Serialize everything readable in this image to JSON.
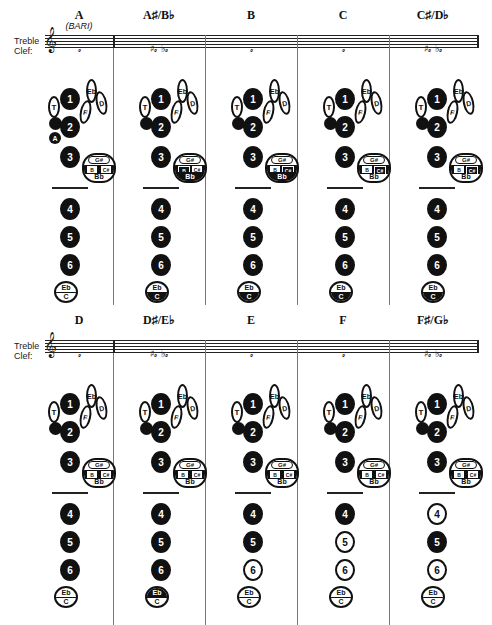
{
  "clef": {
    "line1": "Treble",
    "line2": "Clef:"
  },
  "key_labels": {
    "thumb": "T",
    "k1": "1",
    "k2": "2",
    "k3": "3",
    "k4": "4",
    "k5": "5",
    "k6": "6",
    "eb_side": "Eb",
    "f_side": "F",
    "d_side": "D",
    "gs": "G#",
    "b": "B",
    "cs": "C#",
    "bb": "Bb",
    "eb_low": "Eb",
    "c_low": "C",
    "a": "A"
  },
  "rows": [
    {
      "notes": [
        {
          "name": "A",
          "sub": "(BARI)",
          "staff_note": "𝅗",
          "keys": {
            "k1": true,
            "k2": true,
            "k3": true,
            "k4": true,
            "k5": true,
            "k6": true,
            "octave": true,
            "a": true,
            "eb_low": false,
            "c_low": false,
            "gs": false,
            "b": false,
            "cs": false,
            "bb": false
          }
        },
        {
          "name": "A♯/B♭",
          "sub": "",
          "staff_note": "♯𝅗 ♭𝅗",
          "keys": {
            "k1": true,
            "k2": true,
            "k3": true,
            "k4": true,
            "k5": true,
            "k6": true,
            "octave": true,
            "a": false,
            "eb_low": false,
            "c_low": true,
            "gs": false,
            "b": true,
            "cs": false,
            "bb": true
          }
        },
        {
          "name": "B",
          "sub": "",
          "staff_note": "𝅗",
          "keys": {
            "k1": true,
            "k2": true,
            "k3": true,
            "k4": true,
            "k5": true,
            "k6": true,
            "octave": true,
            "a": false,
            "eb_low": false,
            "c_low": true,
            "gs": false,
            "b": false,
            "cs": true,
            "bb": true
          }
        },
        {
          "name": "C",
          "sub": "",
          "staff_note": "𝅗",
          "keys": {
            "k1": true,
            "k2": true,
            "k3": true,
            "k4": true,
            "k5": true,
            "k6": true,
            "octave": true,
            "a": false,
            "eb_low": false,
            "c_low": true,
            "gs": false,
            "b": false,
            "cs": true,
            "bb": false
          }
        },
        {
          "name": "C♯/D♭",
          "sub": "",
          "staff_note": "♯𝅗 ♭𝅗",
          "keys": {
            "k1": true,
            "k2": true,
            "k3": true,
            "k4": true,
            "k5": true,
            "k6": true,
            "octave": true,
            "a": false,
            "eb_low": false,
            "c_low": true,
            "gs": false,
            "b": false,
            "cs": true,
            "bb": false
          }
        }
      ]
    },
    {
      "notes": [
        {
          "name": "D",
          "sub": "",
          "staff_note": "𝅗",
          "keys": {
            "k1": true,
            "k2": true,
            "k3": true,
            "k4": true,
            "k5": true,
            "k6": true,
            "octave": true,
            "a": false,
            "eb_low": false,
            "c_low": false,
            "gs": false,
            "b": false,
            "cs": false,
            "bb": false
          }
        },
        {
          "name": "D♯/E♭",
          "sub": "",
          "staff_note": "♯𝅗 ♭𝅗",
          "keys": {
            "k1": true,
            "k2": true,
            "k3": true,
            "k4": true,
            "k5": true,
            "k6": true,
            "octave": true,
            "a": false,
            "eb_low": true,
            "c_low": false,
            "gs": false,
            "b": false,
            "cs": false,
            "bb": false
          }
        },
        {
          "name": "E",
          "sub": "",
          "staff_note": "𝅗",
          "keys": {
            "k1": true,
            "k2": true,
            "k3": true,
            "k4": true,
            "k5": true,
            "k6": false,
            "octave": true,
            "a": false,
            "eb_low": false,
            "c_low": false,
            "gs": false,
            "b": false,
            "cs": false,
            "bb": false
          }
        },
        {
          "name": "F",
          "sub": "",
          "staff_note": "𝅗",
          "keys": {
            "k1": true,
            "k2": true,
            "k3": true,
            "k4": true,
            "k5": false,
            "k6": false,
            "octave": true,
            "a": false,
            "eb_low": false,
            "c_low": false,
            "gs": false,
            "b": false,
            "cs": false,
            "bb": false
          }
        },
        {
          "name": "F♯/G♭",
          "sub": "",
          "staff_note": "♯𝅗 ♭𝅗",
          "keys": {
            "k1": true,
            "k2": true,
            "k3": true,
            "k4": false,
            "k5": true,
            "k6": false,
            "octave": true,
            "a": false,
            "eb_low": false,
            "c_low": false,
            "gs": false,
            "b": false,
            "cs": false,
            "bb": false
          }
        }
      ]
    }
  ]
}
